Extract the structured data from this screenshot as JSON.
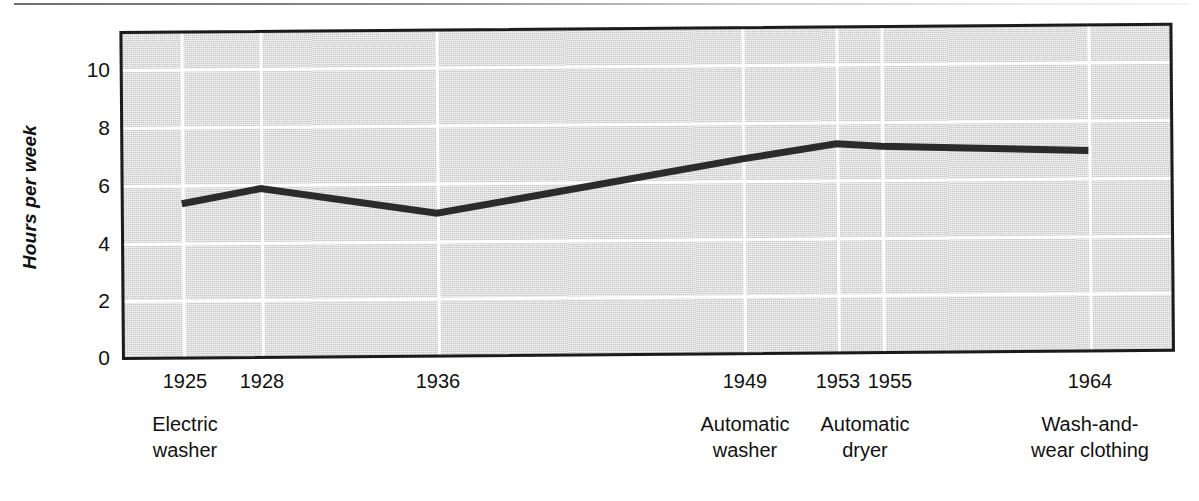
{
  "chart_data": {
    "type": "line",
    "title": "",
    "subtitle": "",
    "xlabel": "",
    "ylabel": "Hours per week",
    "ylim": [
      0,
      11.4
    ],
    "yticks": [
      0,
      2,
      4,
      6,
      8,
      10
    ],
    "ytick_labels": [
      "0",
      "2",
      "4",
      "6",
      "8",
      "10"
    ],
    "x": [
      1925,
      1928,
      1936,
      1949,
      1953,
      1955,
      1964
    ],
    "xtick_labels": [
      "1925",
      "1928",
      "1936",
      "1949",
      "1953",
      "1955",
      "1964"
    ],
    "values": [
      5.4,
      5.9,
      5.0,
      6.8,
      7.3,
      7.2,
      7.0
    ],
    "grid": true,
    "grid_color": "#ffffff",
    "plot_background": "#c8c8c8",
    "line_color": "#2b2b2b",
    "legend": "none",
    "series": [
      {
        "name": "Hours per week",
        "points": [
          {
            "x": 1925,
            "y": 5.4
          },
          {
            "x": 1928,
            "y": 5.9
          },
          {
            "x": 1936,
            "y": 5.0
          },
          {
            "x": 1949,
            "y": 6.8
          },
          {
            "x": 1953,
            "y": 7.3
          },
          {
            "x": 1955,
            "y": 7.2
          },
          {
            "x": 1964,
            "y": 7.0
          }
        ]
      }
    ],
    "annotations": [
      {
        "x": 1925,
        "text": "Electric\nwasher"
      },
      {
        "x": 1949,
        "text": "Automatic\nwasher"
      },
      {
        "x": 1953,
        "text": "Automatic\ndryer"
      },
      {
        "x": 1964,
        "text": "Wash-and-\nwear clothing"
      }
    ]
  },
  "axis": {
    "y_label": "Hours per week",
    "y_ticks": [
      "10",
      "8",
      "6",
      "4",
      "2",
      "0"
    ],
    "x_ticks": [
      "1925",
      "1928",
      "1936",
      "1949",
      "1953",
      "1955",
      "1964"
    ]
  },
  "captions": {
    "electric_washer": "Electric\nwasher",
    "automatic_washer": "Automatic\nwasher",
    "automatic_dryer": "Automatic\ndryer",
    "wash_and_wear": "Wash-and-\nwear clothing"
  },
  "colors": {
    "plot_background": "#c8c8c8",
    "grid": "#ffffff",
    "line": "#2b2b2b",
    "frame": "#1b1b1b",
    "text": "#111111"
  }
}
